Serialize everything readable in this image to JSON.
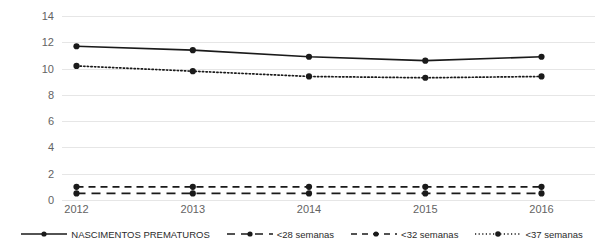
{
  "chart_data": {
    "type": "line",
    "title": "",
    "xlabel": "",
    "ylabel": "",
    "categories": [
      "2012",
      "2013",
      "2014",
      "2015",
      "2016"
    ],
    "ylim": [
      0,
      14
    ],
    "yticks": [
      0,
      2,
      4,
      6,
      8,
      10,
      12,
      14
    ],
    "grid": true,
    "legend_position": "bottom",
    "series": [
      {
        "name": "NASCIMENTOS PREMATUROS",
        "style": "solid",
        "marker": "circle",
        "color": "#1a1a1a",
        "values": [
          11.7,
          11.4,
          10.9,
          10.6,
          10.9
        ]
      },
      {
        "name": "<28 semanas",
        "style": "dash-dot",
        "marker": "circle",
        "color": "#1a1a1a",
        "values": [
          0.5,
          0.5,
          0.5,
          0.5,
          0.5
        ]
      },
      {
        "name": "<32 semanas",
        "style": "dashed",
        "marker": "circle",
        "color": "#1a1a1a",
        "values": [
          1.0,
          1.0,
          1.0,
          1.0,
          1.0
        ]
      },
      {
        "name": "<37 semanas",
        "style": "dotted",
        "marker": "circle",
        "color": "#1a1a1a",
        "values": [
          10.2,
          9.8,
          9.4,
          9.3,
          9.4
        ]
      }
    ]
  },
  "axis": {
    "y_tick_labels": [
      "14",
      "12",
      "10",
      "8",
      "6",
      "4",
      "2",
      "0"
    ],
    "x_tick_labels": [
      "2012",
      "2013",
      "2014",
      "2015",
      "2016"
    ]
  },
  "legend": {
    "items": [
      {
        "label": "NASCIMENTOS PREMATUROS",
        "style": "solid"
      },
      {
        "label": "<28 semanas",
        "style": "dash-dot"
      },
      {
        "label": "<32 semanas",
        "style": "dashed"
      },
      {
        "label": "<37 semanas",
        "style": "dotted"
      }
    ]
  },
  "colors": {
    "grid": "#e6e6e6",
    "tick_text": "#636363",
    "series": "#1a1a1a",
    "background": "#ffffff"
  }
}
